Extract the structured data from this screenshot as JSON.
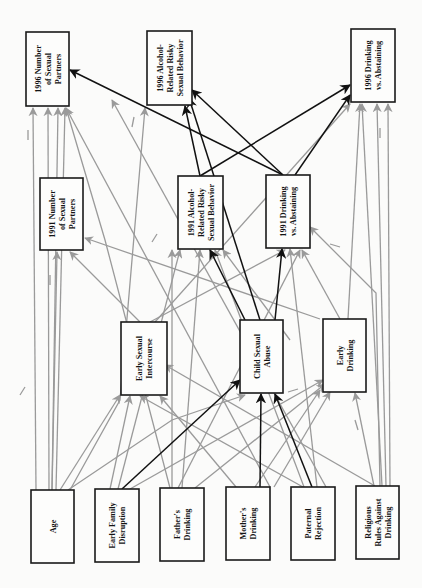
{
  "diagram": {
    "orientation": "rotated 90deg counter-clockwise (labels read bottom-to-top)",
    "colors": {
      "background": "#fbfbfa",
      "box_stroke": "#1a1a1a",
      "significant_path": "#111111",
      "control_path": "#9a9a9a"
    },
    "nodes": [
      {
        "id": "n1996num",
        "lines": [
          "1996 Number",
          "of Sexual",
          "Partners"
        ],
        "x": 26,
        "y": 32,
        "w": 43,
        "h": 74
      },
      {
        "id": "n1996alc",
        "lines": [
          "1996 Alcohol-",
          "Related Risky",
          "Sexual Behavior"
        ],
        "x": 147,
        "y": 31,
        "w": 45,
        "h": 74
      },
      {
        "id": "n1996drk",
        "lines": [
          "1996 Drinking",
          "vs. Abstaining"
        ],
        "x": 351,
        "y": 29,
        "w": 44,
        "h": 73
      },
      {
        "id": "n1991num",
        "lines": [
          "1991 Number",
          "of Sexual",
          "Partners"
        ],
        "x": 40,
        "y": 178,
        "w": 43,
        "h": 72
      },
      {
        "id": "n1991alc",
        "lines": [
          "1991 Alcohol-",
          "Related Risky",
          "Sexual Behavior"
        ],
        "x": 178,
        "y": 176,
        "w": 45,
        "h": 73
      },
      {
        "id": "n1991drk",
        "lines": [
          "1991 Drinking",
          "vs. Abstaining"
        ],
        "x": 266,
        "y": 175,
        "w": 44,
        "h": 73
      },
      {
        "id": "esi",
        "lines": [
          "Early Sexual",
          "Intercourse"
        ],
        "x": 121,
        "y": 322,
        "w": 46,
        "h": 73
      },
      {
        "id": "csa",
        "lines": [
          "Child Sexual",
          "Abuse"
        ],
        "x": 240,
        "y": 320,
        "w": 43,
        "h": 73
      },
      {
        "id": "edr",
        "lines": [
          "Early",
          "Drinking"
        ],
        "x": 323,
        "y": 319,
        "w": 43,
        "h": 73
      },
      {
        "id": "age",
        "lines": [
          "Age"
        ],
        "x": 31,
        "y": 490,
        "w": 43,
        "h": 73
      },
      {
        "id": "efd",
        "lines": [
          "Early Family",
          "Disruption"
        ],
        "x": 95,
        "y": 489,
        "w": 44,
        "h": 73
      },
      {
        "id": "fdr",
        "lines": [
          "Father's",
          "Drinking"
        ],
        "x": 160,
        "y": 488,
        "w": 44,
        "h": 73
      },
      {
        "id": "mdr",
        "lines": [
          "Mother's",
          "Drinking"
        ],
        "x": 226,
        "y": 487,
        "w": 44,
        "h": 73
      },
      {
        "id": "prj",
        "lines": [
          "Paternal",
          "Rejection"
        ],
        "x": 291,
        "y": 487,
        "w": 44,
        "h": 73
      },
      {
        "id": "rrd",
        "lines": [
          "Religious",
          "Rules Against",
          "Drinking"
        ],
        "x": 356,
        "y": 486,
        "w": 43,
        "h": 73
      }
    ],
    "black_edges": [
      {
        "from": [
          200,
          176
        ],
        "to": [
          185,
          106
        ]
      },
      {
        "from": [
          200,
          176
        ],
        "to": [
          350,
          85
        ]
      },
      {
        "from": [
          283,
          175
        ],
        "to": [
          70,
          70
        ]
      },
      {
        "from": [
          283,
          175
        ],
        "to": [
          192,
          90
        ]
      },
      {
        "from": [
          295,
          175
        ],
        "to": [
          350,
          95
        ]
      },
      {
        "from": [
          260,
          320
        ],
        "to": [
          189,
          98
        ]
      },
      {
        "from": [
          245,
          320
        ],
        "to": [
          210,
          250
        ]
      },
      {
        "from": [
          275,
          320
        ],
        "to": [
          282,
          249
        ]
      },
      {
        "from": [
          122,
          489
        ],
        "to": [
          240,
          380
        ]
      },
      {
        "from": [
          260,
          487
        ],
        "to": [
          261,
          394
        ]
      },
      {
        "from": [
          312,
          487
        ],
        "to": [
          275,
          394
        ]
      }
    ],
    "gray_edges": [
      {
        "from": [
          36,
          490
        ],
        "to": [
          33,
          108
        ]
      },
      {
        "from": [
          49,
          490
        ],
        "to": [
          48,
          108
        ]
      },
      {
        "from": [
          52,
          490
        ],
        "to": [
          58,
          108
        ]
      },
      {
        "from": [
          56,
          490
        ],
        "to": [
          65,
          108
        ]
      },
      {
        "from": [
          52,
          490
        ],
        "to": [
          57,
          252
        ]
      },
      {
        "from": [
          60,
          490
        ],
        "to": [
          120,
          395
        ]
      },
      {
        "from": [
          68,
          490
        ],
        "to": [
          172,
          420
        ],
        "via": [
          [
            172,
            420
          ],
          [
            230,
            395
          ]
        ],
        "to2": [
          245,
          395
        ]
      },
      {
        "from": [
          70,
          490
        ],
        "to": [
          120,
          400
        ],
        "to3": [
          145,
          108
        ]
      },
      {
        "from": [
          110,
          489
        ],
        "to": [
          130,
          396
        ]
      },
      {
        "from": [
          118,
          489
        ],
        "to": [
          180,
          250
        ]
      },
      {
        "from": [
          130,
          489
        ],
        "to": [
          323,
          380
        ]
      },
      {
        "from": [
          170,
          488
        ],
        "to": [
          105,
          240
        ],
        "to4": [
          66,
          108
        ]
      },
      {
        "from": [
          172,
          488
        ],
        "to": [
          172,
          250
        ]
      },
      {
        "from": [
          178,
          488
        ],
        "to": [
          300,
          250
        ]
      },
      {
        "from": [
          182,
          488
        ],
        "to": [
          200,
          250
        ]
      },
      {
        "from": [
          195,
          488
        ],
        "to": [
          325,
          384
        ]
      },
      {
        "from": [
          236,
          487
        ],
        "to": [
          160,
          396
        ]
      },
      {
        "from": [
          255,
          487
        ],
        "to": [
          320,
          390
        ]
      },
      {
        "from": [
          270,
          487
        ],
        "to": [
          66,
          108
        ]
      },
      {
        "from": [
          274,
          487
        ],
        "to": [
          330,
          392
        ]
      },
      {
        "from": [
          303,
          487
        ],
        "to": [
          140,
          396
        ]
      },
      {
        "from": [
          304,
          487
        ],
        "to": [
          215,
          250
        ]
      },
      {
        "from": [
          317,
          487
        ],
        "to": [
          290,
          249
        ]
      },
      {
        "from": [
          326,
          487
        ],
        "to": [
          112,
          100
        ]
      },
      {
        "from": [
          374,
          486
        ],
        "to": [
          355,
          393
        ]
      },
      {
        "from": [
          386,
          486
        ],
        "to": [
          377,
          104
        ]
      },
      {
        "from": [
          382,
          486
        ],
        "to": [
          362,
          104
        ]
      },
      {
        "from": [
          390,
          486
        ],
        "to": [
          388,
          104
        ]
      },
      {
        "from": [
          380,
          486
        ],
        "to": [
          376,
          293
        ],
        "to5": [
          310,
          227
        ]
      },
      {
        "from": [
          375,
          486
        ],
        "to": [
          165,
          365
        ]
      },
      {
        "from": [
          320,
          319
        ],
        "to": [
          85,
          238
        ]
      },
      {
        "from": [
          340,
          319
        ],
        "to": [
          302,
          250
        ]
      },
      {
        "from": [
          348,
          319
        ],
        "to": [
          360,
          104
        ]
      },
      {
        "from": [
          290,
          340
        ],
        "to": [
          223,
          250
        ]
      },
      {
        "from": [
          140,
          322
        ],
        "to": [
          70,
          252
        ]
      },
      {
        "from": [
          155,
          322
        ],
        "to": [
          350,
          104
        ]
      },
      {
        "from": [
          150,
          322
        ],
        "to": [
          285,
          250
        ]
      }
    ],
    "negative_marks": [
      {
        "x1": 28,
        "y1": 130,
        "x2": 28,
        "y2": 140
      },
      {
        "x1": 134,
        "y1": 117,
        "x2": 132,
        "y2": 127
      },
      {
        "x1": 50,
        "y1": 275,
        "x2": 50,
        "y2": 285
      },
      {
        "x1": 152,
        "y1": 242,
        "x2": 157,
        "y2": 234
      },
      {
        "x1": 380,
        "y1": 128,
        "x2": 380,
        "y2": 138
      },
      {
        "x1": 330,
        "y1": 244,
        "x2": 340,
        "y2": 247
      },
      {
        "x1": 20,
        "y1": 395,
        "x2": 25,
        "y2": 387
      },
      {
        "x1": 288,
        "y1": 392,
        "x2": 298,
        "y2": 389
      },
      {
        "x1": 355,
        "y1": 420,
        "x2": 358,
        "y2": 430
      }
    ]
  }
}
